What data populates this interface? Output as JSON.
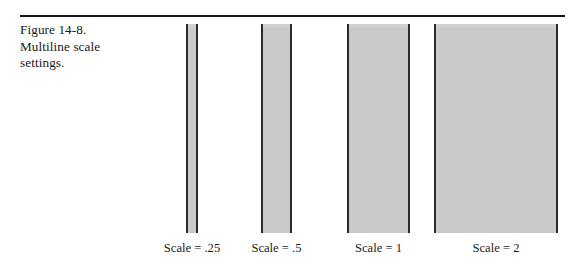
{
  "figure": {
    "caption_lines": [
      "Figure 14-8.",
      "Multiline scale",
      "settings."
    ],
    "rule_color": "#151515"
  },
  "chart_data": {
    "type": "bar",
    "title": "Multiline scale settings",
    "xlabel": "",
    "ylabel": "",
    "grid": false,
    "legend": null,
    "orientation": "vertical",
    "note": "Four gray bars of equal height; width doubles with each scale step, illustrating the multiline scale setting.",
    "categories": [
      "Scale = .25",
      "Scale = .5",
      "Scale = 1",
      "Scale = 2"
    ],
    "values": [
      0.25,
      0.5,
      1,
      2
    ],
    "bar_widths_px": [
      12,
      31,
      63,
      124
    ],
    "bar_left_px": [
      186,
      261,
      347,
      434
    ],
    "bar_top_px": 24,
    "bar_height_px": 209,
    "fill_color": "#c9c9c9",
    "edge_color": "#2b2b2b"
  }
}
